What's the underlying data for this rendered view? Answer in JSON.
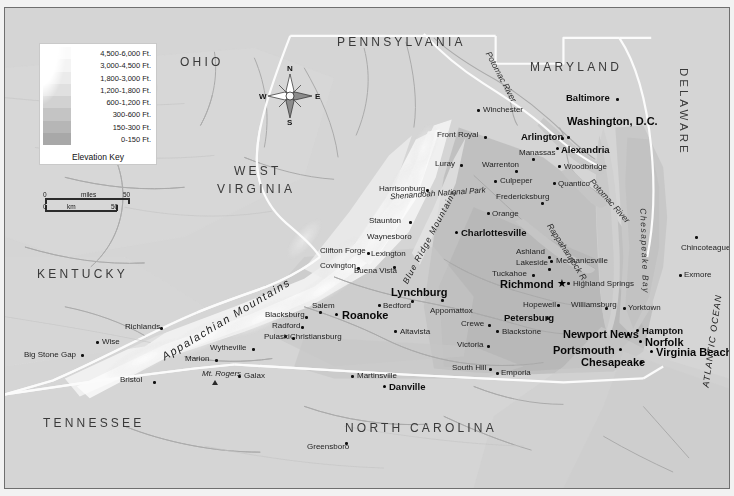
{
  "map": {
    "title": "Virginia Elevation Map",
    "legend": {
      "caption": "Elevation Key",
      "entries": [
        {
          "label": "4,500-6,000 Ft.",
          "color": "#fbfbfb"
        },
        {
          "label": "3,000-4,500 Ft.",
          "color": "#f4f4f4"
        },
        {
          "label": "1,800-3,000 Ft.",
          "color": "#ebebeb"
        },
        {
          "label": "1,200-1,800 Ft.",
          "color": "#e0e0e0"
        },
        {
          "label": "600-1,200 Ft.",
          "color": "#d2d2d2"
        },
        {
          "label": "300-600 Ft.",
          "color": "#c4c4c4"
        },
        {
          "label": "150-300 Ft.",
          "color": "#b6b6b6"
        },
        {
          "label": "0-150 Ft.",
          "color": "#a8a8a8"
        }
      ]
    },
    "scale": {
      "miles_label": "miles",
      "km_label": "km",
      "miles_zero": "0",
      "miles_max": "50",
      "km_zero": "0",
      "km_max": "50"
    },
    "compass": {
      "north": "N",
      "south": "S",
      "east": "E",
      "west": "W"
    },
    "states": [
      {
        "name": "OHIO",
        "x": 175,
        "y": 48
      },
      {
        "name": "PENNSYLVANIA",
        "x": 332,
        "y": 28
      },
      {
        "name": "MARYLAND",
        "x": 525,
        "y": 53
      },
      {
        "name": "DELAWARE",
        "x": 672,
        "y": 60
      },
      {
        "name": "WEST",
        "x": 229,
        "y": 157
      },
      {
        "name": "VIRGINIA",
        "x": 212,
        "y": 175
      },
      {
        "name": "KENTUCKY",
        "x": 32,
        "y": 260
      },
      {
        "name": "TENNESSEE",
        "x": 38,
        "y": 409
      },
      {
        "name": "NORTH CAROLINA",
        "x": 340,
        "y": 414
      }
    ],
    "water_labels": [
      {
        "name": "Potomac River",
        "x": 483,
        "y": 40,
        "rotate": 62
      },
      {
        "name": "Potomac River",
        "x": 586,
        "y": 168,
        "rotate": 48
      },
      {
        "name": "Rappahannock R.",
        "x": 544,
        "y": 212,
        "rotate": 57
      },
      {
        "name": "Chesapeake Bay",
        "x": 638,
        "y": 196,
        "rotate": 88
      },
      {
        "name": "ATLANTIC OCEAN",
        "x": 701,
        "y": 375,
        "rotate": -82
      }
    ],
    "region_labels": [
      {
        "name": "Appalachian Mountains",
        "x": 158,
        "y": 344,
        "rotate": -31
      },
      {
        "name": "Blue Ridge Mountains",
        "x": 400,
        "y": 271,
        "rotate": -62
      },
      {
        "name": "Shenandoah National Park",
        "x": 398,
        "y": 186,
        "rotate": 0
      },
      {
        "name": "Mt. Rogers",
        "x": 197,
        "y": 362,
        "rotate": 0
      }
    ],
    "capital": {
      "name": "Richmond",
      "x": 495,
      "y": 277,
      "marker": "star"
    },
    "cities": [
      {
        "name": "Winchester",
        "x": 478,
        "y": 101,
        "size": "small",
        "dot": "left"
      },
      {
        "name": "Baltimore",
        "x": 561,
        "y": 89,
        "size": "medium",
        "dot": "right"
      },
      {
        "name": "Washington, D.C.",
        "x": 570,
        "y": 113,
        "size": "large",
        "dot": "left"
      },
      {
        "name": "Arlington",
        "x": 519,
        "y": 126,
        "size": "medium",
        "dot": "right"
      },
      {
        "name": "Alexandria",
        "x": 553,
        "y": 140,
        "size": "medium",
        "dot": "left"
      },
      {
        "name": "Manassas",
        "x": 514,
        "y": 144,
        "size": "small",
        "dot": "none"
      },
      {
        "name": "Woodbridge",
        "x": 565,
        "y": 157,
        "size": "small",
        "dot": "left"
      },
      {
        "name": "Quantico",
        "x": 560,
        "y": 175,
        "size": "small",
        "dot": "left"
      },
      {
        "name": "Front Royal",
        "x": 435,
        "y": 126,
        "size": "small",
        "dot": "right"
      },
      {
        "name": "Warrenton",
        "x": 480,
        "y": 156,
        "size": "small",
        "dot": "none"
      },
      {
        "name": "Luray",
        "x": 434,
        "y": 155,
        "size": "small",
        "dot": "right"
      },
      {
        "name": "Culpeper",
        "x": 495,
        "y": 172,
        "size": "small",
        "dot": "left"
      },
      {
        "name": "Fredericksburg",
        "x": 497,
        "y": 188,
        "size": "small",
        "dot": "none"
      },
      {
        "name": "Harrisonburg",
        "x": 377,
        "y": 180,
        "size": "small",
        "dot": "right"
      },
      {
        "name": "Orange",
        "x": 487,
        "y": 205,
        "size": "small",
        "dot": "left"
      },
      {
        "name": "Staunton",
        "x": 368,
        "y": 212,
        "size": "small",
        "dot": "right"
      },
      {
        "name": "Charlottesville",
        "x": 456,
        "y": 224,
        "size": "medium",
        "dot": "left"
      },
      {
        "name": "Waynesboro",
        "x": 365,
        "y": 228,
        "size": "small",
        "dot": "none"
      },
      {
        "name": "Clifton Forge",
        "x": 318,
        "y": 242,
        "size": "small",
        "dot": "right"
      },
      {
        "name": "Lexington",
        "x": 366,
        "y": 245,
        "size": "small",
        "dot": "none"
      },
      {
        "name": "Ashland",
        "x": 513,
        "y": 243,
        "size": "small",
        "dot": "right"
      },
      {
        "name": "Covington",
        "x": 318,
        "y": 257,
        "size": "small",
        "dot": "right"
      },
      {
        "name": "Buena Vista",
        "x": 352,
        "y": 262,
        "size": "small",
        "dot": "right"
      },
      {
        "name": "Lakeside",
        "x": 514,
        "y": 254,
        "size": "small",
        "dot": "right"
      },
      {
        "name": "Mechanicsville",
        "x": 551,
        "y": 252,
        "size": "small",
        "dot": "left"
      },
      {
        "name": "Tuckahoe",
        "x": 490,
        "y": 265,
        "size": "small",
        "dot": "right"
      },
      {
        "name": "Highland Springs",
        "x": 548,
        "y": 275,
        "size": "small",
        "dot": "left"
      },
      {
        "name": "Lynchburg",
        "x": 388,
        "y": 283,
        "size": "medium",
        "dot": "below"
      },
      {
        "name": "Salem",
        "x": 310,
        "y": 297,
        "size": "small",
        "dot": "below"
      },
      {
        "name": "Bedford",
        "x": 378,
        "y": 297,
        "size": "small",
        "dot": "left"
      },
      {
        "name": "Roanoke",
        "x": 337,
        "y": 307,
        "size": "medium",
        "dot": "left"
      },
      {
        "name": "Appomattox",
        "x": 428,
        "y": 301,
        "size": "small",
        "dot": "none"
      },
      {
        "name": "Hopewell",
        "x": 520,
        "y": 296,
        "size": "small",
        "dot": "right"
      },
      {
        "name": "Williamsburg",
        "x": 568,
        "y": 296,
        "size": "small",
        "dot": "none"
      },
      {
        "name": "Yorktown",
        "x": 621,
        "y": 299,
        "size": "small",
        "dot": "left"
      },
      {
        "name": "Blacksburg",
        "x": 263,
        "y": 306,
        "size": "small",
        "dot": "right"
      },
      {
        "name": "Petersburg",
        "x": 500,
        "y": 308,
        "size": "medium",
        "dot": "right"
      },
      {
        "name": "Crewe",
        "x": 458,
        "y": 315,
        "size": "small",
        "dot": "right"
      },
      {
        "name": "Richlands",
        "x": 123,
        "y": 318,
        "size": "small",
        "dot": "right"
      },
      {
        "name": "Radford",
        "x": 270,
        "y": 317,
        "size": "small",
        "dot": "right"
      },
      {
        "name": "Christiansburg",
        "x": 283,
        "y": 328,
        "size": "small",
        "dot": "left"
      },
      {
        "name": "Blackstone",
        "x": 495,
        "y": 323,
        "size": "small",
        "dot": "left"
      },
      {
        "name": "Altavista",
        "x": 393,
        "y": 322,
        "size": "small",
        "dot": "left"
      },
      {
        "name": "Pulaski",
        "x": 262,
        "y": 328,
        "size": "small",
        "dot": "right"
      },
      {
        "name": "Wise",
        "x": 95,
        "y": 333,
        "size": "small",
        "dot": "left"
      },
      {
        "name": "Newport News",
        "x": 561,
        "y": 326,
        "size": "medium",
        "dot": "right"
      },
      {
        "name": "Hampton",
        "x": 634,
        "y": 321,
        "size": "medium",
        "dot": "left"
      },
      {
        "name": "Norfolk",
        "x": 637,
        "y": 333,
        "size": "medium",
        "dot": "left"
      },
      {
        "name": "Wytheville",
        "x": 208,
        "y": 339,
        "size": "small",
        "dot": "right"
      },
      {
        "name": "Victoria",
        "x": 455,
        "y": 336,
        "size": "small",
        "dot": "right"
      },
      {
        "name": "Portsmouth",
        "x": 550,
        "y": 342,
        "size": "medium",
        "dot": "right"
      },
      {
        "name": "Virginia Beach",
        "x": 654,
        "y": 344,
        "size": "medium",
        "dot": "left"
      },
      {
        "name": "Big Stone Gap",
        "x": 22,
        "y": 346,
        "size": "small",
        "dot": "right"
      },
      {
        "name": "Marion",
        "x": 183,
        "y": 350,
        "size": "small",
        "dot": "right"
      },
      {
        "name": "Chesapeake",
        "x": 578,
        "y": 354,
        "size": "medium",
        "dot": "right"
      },
      {
        "name": "South Hill",
        "x": 450,
        "y": 359,
        "size": "small",
        "dot": "right"
      },
      {
        "name": "Emporia",
        "x": 493,
        "y": 364,
        "size": "small",
        "dot": "left"
      },
      {
        "name": "Galax",
        "x": 236,
        "y": 367,
        "size": "small",
        "dot": "left"
      },
      {
        "name": "Martinsville",
        "x": 349,
        "y": 367,
        "size": "small",
        "dot": "left"
      },
      {
        "name": "Bristol",
        "x": 118,
        "y": 371,
        "size": "small",
        "dot": "right"
      },
      {
        "name": "Danville",
        "x": 381,
        "y": 377,
        "size": "medium",
        "dot": "left"
      },
      {
        "name": "Greensboro",
        "x": 304,
        "y": 437,
        "size": "small",
        "dot": "right"
      },
      {
        "name": "Chincoteague",
        "x": 679,
        "y": 235,
        "size": "small",
        "dot": "above"
      },
      {
        "name": "Exmore",
        "x": 677,
        "y": 266,
        "size": "small",
        "dot": "left"
      }
    ]
  }
}
